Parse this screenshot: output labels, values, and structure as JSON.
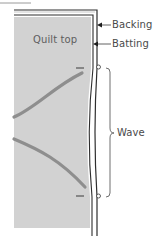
{
  "diagram": {
    "labels": {
      "quilt_top": "Quilt top",
      "backing": "Backing",
      "batting": "Batting",
      "wave": "Wave"
    },
    "colors": {
      "quilt_fill": "#d2d2d2",
      "stripe": "#8e8e8e",
      "outline": "#2e2e2e",
      "backing_edge": "#9a9a9a",
      "text": "#4a4a4a"
    },
    "layers": [
      "Backing",
      "Batting",
      "Quilt top"
    ]
  }
}
